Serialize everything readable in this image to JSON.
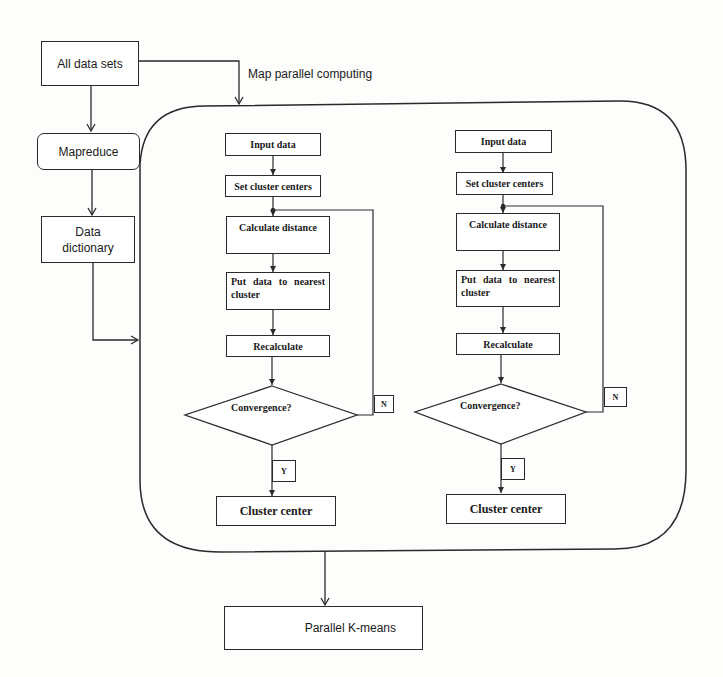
{
  "diagram": {
    "left_column": {
      "all_data_sets": "All data sets",
      "mapreduce": "Mapreduce",
      "data_dictionary_line1": "Data",
      "data_dictionary_line2": "dictionary"
    },
    "map_label": "Map parallel computing",
    "pipelines": [
      {
        "input_data": "Input data",
        "set_cluster_centers": "Set cluster centers",
        "calculate_distance": "Calculate distance",
        "put_data": "Put data to nearest cluster",
        "recalculate": "Recalculate",
        "convergence": "Convergence?",
        "no_label": "N",
        "yes_label": "Y",
        "cluster_center": "Cluster center"
      },
      {
        "input_data": "Input data",
        "set_cluster_centers": "Set cluster centers",
        "calculate_distance": "Calculate distance",
        "put_data": "Put data to nearest cluster",
        "recalculate": "Recalculate",
        "convergence": "Convergence?",
        "no_label": "N",
        "yes_label": "Y",
        "cluster_center": "Cluster center"
      }
    ],
    "output": "Parallel K-means",
    "colors": {
      "stroke": "#2a2a2a",
      "background": "#fdfdfc"
    }
  }
}
